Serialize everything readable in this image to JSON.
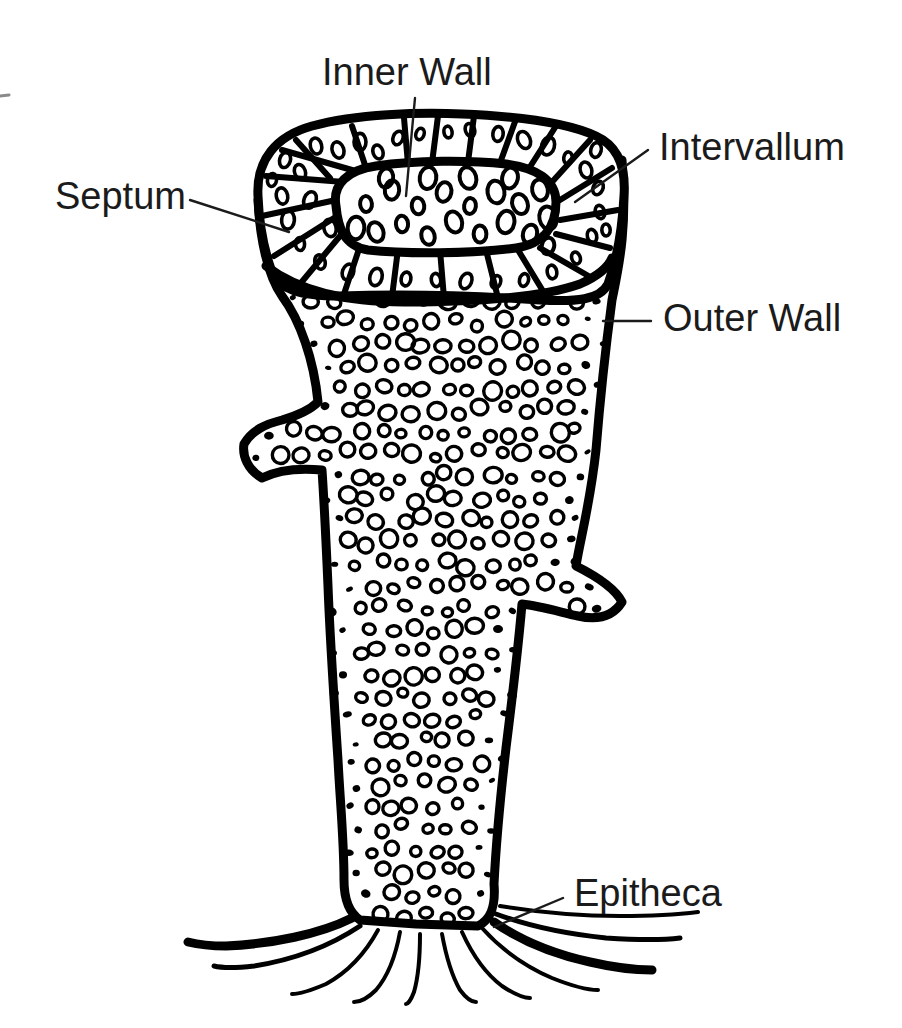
{
  "figure": {
    "kind": "anatomical-line-diagram",
    "background_color": "#ffffff",
    "ink_color": "#000000",
    "label_color": "#1b1b1b",
    "label_font_size_px": 38
  },
  "labels": [
    {
      "id": "inner-wall",
      "text": "Inner Wall",
      "x": 322,
      "y": 75,
      "anchor": "start",
      "leader": [
        [
          415,
          98
        ],
        [
          412,
          130
        ],
        [
          406,
          196
        ]
      ]
    },
    {
      "id": "intervallum",
      "text": "Intervallum",
      "x": 659,
      "y": 150,
      "anchor": "start",
      "leader": [
        [
          648,
          150
        ],
        [
          575,
          202
        ]
      ]
    },
    {
      "id": "septum",
      "text": "Septum",
      "x": 55,
      "y": 199,
      "anchor": "start",
      "leader": [
        [
          190,
          200
        ],
        [
          289,
          232
        ]
      ]
    },
    {
      "id": "outer-wall",
      "text": "Outer Wall",
      "x": 663,
      "y": 321,
      "anchor": "start",
      "leader": [
        [
          651,
          321
        ],
        [
          603,
          321
        ]
      ]
    },
    {
      "id": "epitheca",
      "text": "Epitheca",
      "x": 574,
      "y": 896,
      "anchor": "start",
      "leader": [
        [
          563,
          898
        ],
        [
          494,
          927
        ]
      ]
    }
  ],
  "edge_tick": {
    "x1": 0,
    "y1": 96,
    "x2": 9,
    "y2": 95
  },
  "structures": {
    "outer_wall": {
      "name": "Outer Wall",
      "stroke_width": 9
    },
    "inner_wall": {
      "name": "Inner Wall",
      "stroke_width": 9
    },
    "septa": {
      "name": "Septum",
      "stroke_width": 6,
      "count": 22
    },
    "intervallum": {
      "name": "Intervallum",
      "description": "chambered space between inner and outer walls"
    },
    "epitheca": {
      "name": "Epitheca",
      "description": "root-like basal holdfast filaments",
      "count": 11
    }
  },
  "geometry": {
    "body_outline": "M 622 160 C 628 230 618 270 612 300 C 606 345 600 400 596 450 C 590 505 580 540 576 566 C 600 578 616 590 622 602 C 612 618 596 620 578 616 C 560 612 540 606 522 604 C 518 650 512 700 506 748 C 500 800 496 845 494 884 C 496 908 490 920 478 926 L 416 924 L 360 920 C 348 912 344 898 344 880 C 344 840 340 800 338 760 C 334 700 330 640 328 586 C 326 540 324 500 322 470 C 300 468 278 470 262 478 C 248 470 242 456 244 444 C 252 430 266 424 282 420 C 296 416 310 410 318 402 C 314 360 300 320 282 296 C 268 276 260 240 258 200 Z",
    "top_outer_ring": "M 258 196 C 256 160 276 136 312 126 C 356 114 420 112 462 114 C 512 116 566 122 596 136 C 618 146 626 168 624 196 C 622 232 616 262 608 284 C 600 300 576 302 540 300 C 480 296 400 294 340 296 C 300 296 280 290 272 272 C 264 250 259 222 258 196 Z",
    "inner_cavity": "M 336 206 C 332 184 348 170 376 166 C 416 160 470 160 506 164 C 536 168 556 180 556 202 C 556 226 544 244 516 248 C 472 254 404 254 368 250 C 344 246 338 228 336 206 Z",
    "base_divider": "M 266 266 C 300 292 346 302 404 302 C 470 302 540 298 580 284 C 598 276 608 268 612 258"
  },
  "pore_pattern": {
    "body_ring_radius_px": [
      5,
      9
    ],
    "body_dot_radius_px": [
      3,
      5
    ],
    "ring_stroke_width": 3.4,
    "description": "dense field of circular pores; open rings through mid-body, solid dots near margins"
  },
  "septa_lines": [
    [
      [
        296,
        140
      ],
      [
        330,
        178
      ]
    ],
    [
      [
        352,
        126
      ],
      [
        366,
        168
      ]
    ],
    [
      [
        404,
        118
      ],
      [
        408,
        164
      ]
    ],
    [
      [
        438,
        116
      ],
      [
        432,
        163
      ]
    ],
    [
      [
        474,
        116
      ],
      [
        468,
        162
      ]
    ],
    [
      [
        516,
        119
      ],
      [
        500,
        163
      ]
    ],
    [
      [
        556,
        126
      ],
      [
        528,
        170
      ]
    ],
    [
      [
        590,
        140
      ],
      [
        552,
        182
      ]
    ],
    [
      [
        612,
        168
      ],
      [
        560,
        200
      ]
    ],
    [
      [
        618,
        210
      ],
      [
        560,
        220
      ]
    ],
    [
      [
        610,
        248
      ],
      [
        556,
        234
      ]
    ],
    [
      [
        592,
        278
      ],
      [
        540,
        248
      ]
    ],
    [
      [
        546,
        296
      ],
      [
        518,
        250
      ]
    ],
    [
      [
        498,
        298
      ],
      [
        486,
        250
      ]
    ],
    [
      [
        444,
        298
      ],
      [
        440,
        250
      ]
    ],
    [
      [
        392,
        297
      ],
      [
        398,
        249
      ]
    ],
    [
      [
        344,
        294
      ],
      [
        360,
        246
      ]
    ],
    [
      [
        300,
        284
      ],
      [
        340,
        236
      ]
    ],
    [
      [
        274,
        256
      ],
      [
        334,
        218
      ]
    ],
    [
      [
        262,
        216
      ],
      [
        336,
        200
      ]
    ],
    [
      [
        266,
        176
      ],
      [
        344,
        182
      ]
    ],
    [
      [
        282,
        150
      ],
      [
        352,
        170
      ]
    ]
  ],
  "chamber_pores": [
    [
      285,
      160
    ],
    [
      300,
      172
    ],
    [
      316,
      146
    ],
    [
      338,
      150
    ],
    [
      360,
      142
    ],
    [
      378,
      152
    ],
    [
      398,
      138
    ],
    [
      420,
      134
    ],
    [
      448,
      132
    ],
    [
      470,
      130
    ],
    [
      498,
      134
    ],
    [
      524,
      140
    ],
    [
      548,
      146
    ],
    [
      568,
      158
    ],
    [
      586,
      170
    ],
    [
      598,
      188
    ],
    [
      600,
      212
    ],
    [
      592,
      236
    ],
    [
      576,
      258
    ],
    [
      552,
      272
    ],
    [
      524,
      280
    ],
    [
      496,
      282
    ],
    [
      466,
      281
    ],
    [
      436,
      280
    ],
    [
      406,
      279
    ],
    [
      376,
      277
    ],
    [
      348,
      272
    ],
    [
      320,
      262
    ],
    [
      300,
      244
    ],
    [
      288,
      220
    ],
    [
      282,
      196
    ],
    [
      272,
      180
    ],
    [
      596,
      150
    ],
    [
      606,
      230
    ],
    [
      310,
      200
    ],
    [
      330,
      228
    ]
  ],
  "cavity_pores": [
    [
      366,
      204
    ],
    [
      392,
      190
    ],
    [
      418,
      206
    ],
    [
      444,
      192
    ],
    [
      470,
      206
    ],
    [
      496,
      192
    ],
    [
      520,
      204
    ],
    [
      540,
      190
    ],
    [
      376,
      232
    ],
    [
      402,
      224
    ],
    [
      428,
      236
    ],
    [
      454,
      222
    ],
    [
      480,
      234
    ],
    [
      506,
      222
    ],
    [
      530,
      234
    ],
    [
      548,
      218
    ],
    [
      386,
      178
    ],
    [
      510,
      178
    ],
    [
      468,
      178
    ],
    [
      428,
      178
    ],
    [
      356,
      228
    ],
    [
      548,
      246
    ]
  ],
  "root_filaments": [
    {
      "d": "M 352 918 C 320 934 272 944 226 946 C 208 946 196 944 188 942",
      "w": 9
    },
    {
      "d": "M 360 926 C 330 946 292 960 254 966 C 236 968 222 968 214 966",
      "w": 5
    },
    {
      "d": "M 378 930 C 366 952 348 972 326 984 C 312 990 300 994 292 994",
      "w": 4
    },
    {
      "d": "M 400 932 C 396 954 388 976 376 990 C 368 998 360 1002 354 1002",
      "w": 4
    },
    {
      "d": "M 420 934 C 420 956 418 978 414 992 C 411 1000 408 1004 406 1004",
      "w": 4
    },
    {
      "d": "M 442 934 C 446 956 452 976 460 990 C 466 998 472 1002 476 1002",
      "w": 4
    },
    {
      "d": "M 462 932 C 472 954 486 974 502 986 C 514 994 524 998 530 998",
      "w": 4
    },
    {
      "d": "M 482 928 C 500 948 524 966 552 978 C 572 986 588 990 598 990",
      "w": 4
    },
    {
      "d": "M 494 922 C 520 940 554 954 590 962 C 616 968 638 970 652 970",
      "w": 9
    },
    {
      "d": "M 496 914 C 528 926 566 934 606 938 C 638 940 664 940 680 938",
      "w": 5
    },
    {
      "d": "M 500 906 C 536 912 578 916 620 916 C 654 916 682 914 698 912",
      "w": 4
    }
  ]
}
